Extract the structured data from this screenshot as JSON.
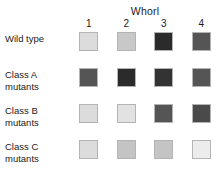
{
  "figure": {
    "title": "Whorl",
    "columns": [
      "1",
      "2",
      "3",
      "4"
    ],
    "rows": [
      {
        "label": "Wild type"
      },
      {
        "label": "Class A\nmutants"
      },
      {
        "label": "Class B\nmutants"
      },
      {
        "label": "Class C\nmutants"
      }
    ]
  },
  "chart_data": {
    "type": "heatmap",
    "title": "Whorl",
    "xlabel": "Whorl",
    "ylabel": "",
    "grid": false,
    "legend": "none",
    "categories": [
      "1",
      "2",
      "3",
      "4"
    ],
    "row_labels": [
      "Wild type",
      "Class A mutants",
      "Class B mutants",
      "Class C mutants"
    ],
    "colorscale": "grayscale",
    "note": "Each cell is a gray-shaded square; darker shades indicate higher gene-activity/organ-identity level.",
    "series": [
      {
        "name": "Wild type",
        "colors": [
          "#dcdcdc",
          "#c8c8c8",
          "#2b2b2b",
          "#555555"
        ],
        "values": [
          0.14,
          0.22,
          0.83,
          0.67
        ]
      },
      {
        "name": "Class A mutants",
        "colors": [
          "#555555",
          "#2b2b2b",
          "#333333",
          "#555555"
        ],
        "values": [
          0.67,
          0.83,
          0.8,
          0.67
        ]
      },
      {
        "name": "Class B mutants",
        "colors": [
          "#dcdcdc",
          "#e2e2e2",
          "#555555",
          "#4a4a4a"
        ],
        "values": [
          0.14,
          0.11,
          0.67,
          0.71
        ]
      },
      {
        "name": "Class C mutants",
        "colors": [
          "#dcdcdc",
          "#c4c4c4",
          "#c4c4c4",
          "#ececec"
        ],
        "values": [
          0.14,
          0.23,
          0.23,
          0.07
        ]
      }
    ]
  }
}
